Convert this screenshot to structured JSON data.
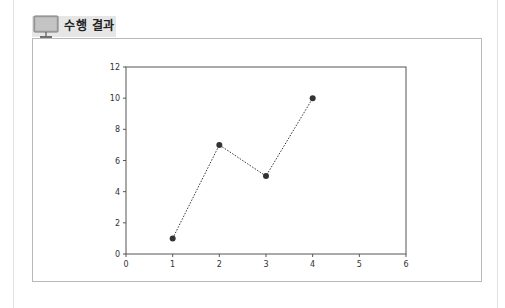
{
  "section": {
    "title": "수행 결과",
    "icon": "monitor-icon"
  },
  "chart_data": {
    "type": "line",
    "title": "",
    "xlabel": "",
    "ylabel": "",
    "x": [
      1,
      2,
      3,
      4
    ],
    "series": [
      {
        "name": "",
        "values": [
          1,
          7,
          5,
          10
        ],
        "line_style": "dotted",
        "marker": "o",
        "color": "#333333"
      }
    ],
    "xlim": [
      0,
      6
    ],
    "ylim": [
      0,
      12
    ],
    "xticks": [
      "0",
      "1",
      "2",
      "3",
      "4",
      "5",
      "6"
    ],
    "yticks": [
      "0",
      "2",
      "4",
      "6",
      "8",
      "10",
      "12"
    ],
    "grid": false,
    "legend": null
  }
}
